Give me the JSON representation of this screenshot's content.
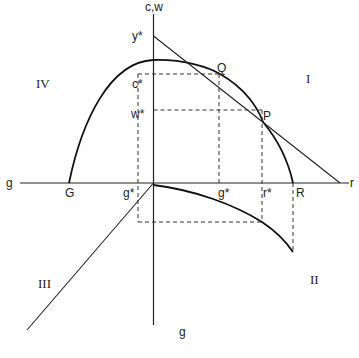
{
  "diagram": {
    "axes": {
      "vertical_top_label": "c,w",
      "vertical_bottom_label": "g",
      "horizontal_left_label": "g",
      "horizontal_right_label": "r"
    },
    "quadrants": {
      "I": "I",
      "II": "II",
      "III": "III",
      "IV": "IV"
    },
    "points": {
      "Q": "Q",
      "P": "P",
      "G": "G",
      "R": "R"
    },
    "axis_marks": {
      "y_star": "y*",
      "c_star": "c*",
      "w_star": "w*",
      "g_star_left": "g*",
      "g_star_right": "g*",
      "r_star": "r*"
    }
  }
}
